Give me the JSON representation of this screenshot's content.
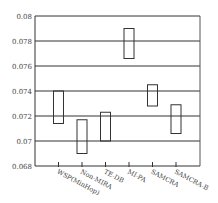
{
  "chart_data": {
    "type": "floating-bar",
    "title": "",
    "xlabel": "",
    "ylabel": "",
    "categories": [
      "WSP(MinHop)",
      "Non-MIRA",
      "TE-DB",
      "MI-PA",
      "SAMCRA",
      "SAMCRA-B"
    ],
    "series": [
      {
        "name": "range",
        "low": [
          0.0714,
          0.069,
          0.07,
          0.0766,
          0.0728,
          0.0706
        ],
        "high": [
          0.074,
          0.0717,
          0.0723,
          0.079,
          0.0745,
          0.0729
        ]
      }
    ],
    "yticks": [
      "0.068",
      "0.07",
      "0.072",
      "0.074",
      "0.076",
      "0.078",
      "0.08"
    ],
    "ylim": [
      0.068,
      0.08
    ],
    "grid": true,
    "legend": null
  }
}
